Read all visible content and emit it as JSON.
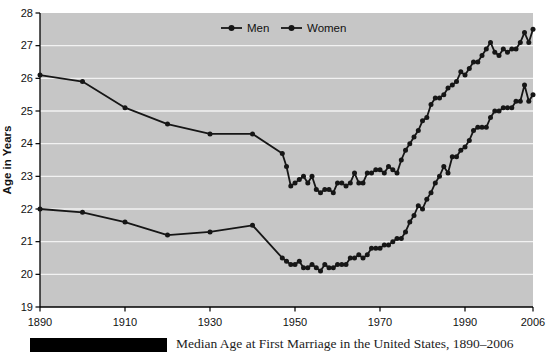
{
  "figure": {
    "caption": "Median Age at First Marriage in the United States, 1890–2006"
  },
  "chart_data": {
    "type": "line",
    "title": "",
    "xlabel": "",
    "ylabel": "Age in Years",
    "xlim": [
      1890,
      2006
    ],
    "ylim": [
      19,
      28
    ],
    "xticks": [
      1890,
      1910,
      1930,
      1950,
      1970,
      1990,
      2006
    ],
    "yticks": [
      19,
      20,
      21,
      22,
      23,
      24,
      25,
      26,
      27,
      28
    ],
    "grid": "horizontal-white-on-gray",
    "legend": {
      "position": "top-center-inside",
      "entries": [
        "Men",
        "Women"
      ]
    },
    "colors": {
      "plot_bg": "#c6c6c6",
      "gridline": "#f2f2f2",
      "line": "#161616",
      "axis": "#000000",
      "page_bg": "#ffffff"
    },
    "series": [
      {
        "name": "Men",
        "points": [
          [
            1890,
            26.1
          ],
          [
            1900,
            25.9
          ],
          [
            1910,
            25.1
          ],
          [
            1920,
            24.6
          ],
          [
            1930,
            24.3
          ],
          [
            1940,
            24.3
          ],
          [
            1947,
            23.7
          ],
          [
            1948,
            23.3
          ],
          [
            1949,
            22.7
          ],
          [
            1950,
            22.8
          ],
          [
            1951,
            22.9
          ],
          [
            1952,
            23.0
          ],
          [
            1953,
            22.8
          ],
          [
            1954,
            23.0
          ],
          [
            1955,
            22.6
          ],
          [
            1956,
            22.5
          ],
          [
            1957,
            22.6
          ],
          [
            1958,
            22.6
          ],
          [
            1959,
            22.5
          ],
          [
            1960,
            22.8
          ],
          [
            1961,
            22.8
          ],
          [
            1962,
            22.7
          ],
          [
            1963,
            22.8
          ],
          [
            1964,
            23.1
          ],
          [
            1965,
            22.8
          ],
          [
            1966,
            22.8
          ],
          [
            1967,
            23.1
          ],
          [
            1968,
            23.1
          ],
          [
            1969,
            23.2
          ],
          [
            1970,
            23.2
          ],
          [
            1971,
            23.1
          ],
          [
            1972,
            23.3
          ],
          [
            1973,
            23.2
          ],
          [
            1974,
            23.1
          ],
          [
            1975,
            23.5
          ],
          [
            1976,
            23.8
          ],
          [
            1977,
            24.0
          ],
          [
            1978,
            24.2
          ],
          [
            1979,
            24.4
          ],
          [
            1980,
            24.7
          ],
          [
            1981,
            24.8
          ],
          [
            1982,
            25.2
          ],
          [
            1983,
            25.4
          ],
          [
            1984,
            25.4
          ],
          [
            1985,
            25.5
          ],
          [
            1986,
            25.7
          ],
          [
            1987,
            25.8
          ],
          [
            1988,
            25.9
          ],
          [
            1989,
            26.2
          ],
          [
            1990,
            26.1
          ],
          [
            1991,
            26.3
          ],
          [
            1992,
            26.5
          ],
          [
            1993,
            26.5
          ],
          [
            1994,
            26.7
          ],
          [
            1995,
            26.9
          ],
          [
            1996,
            27.1
          ],
          [
            1997,
            26.8
          ],
          [
            1998,
            26.7
          ],
          [
            1999,
            26.9
          ],
          [
            2000,
            26.8
          ],
          [
            2001,
            26.9
          ],
          [
            2002,
            26.9
          ],
          [
            2003,
            27.1
          ],
          [
            2004,
            27.4
          ],
          [
            2005,
            27.1
          ],
          [
            2006,
            27.5
          ]
        ]
      },
      {
        "name": "Women",
        "points": [
          [
            1890,
            22.0
          ],
          [
            1900,
            21.9
          ],
          [
            1910,
            21.6
          ],
          [
            1920,
            21.2
          ],
          [
            1930,
            21.3
          ],
          [
            1940,
            21.5
          ],
          [
            1947,
            20.5
          ],
          [
            1948,
            20.4
          ],
          [
            1949,
            20.3
          ],
          [
            1950,
            20.3
          ],
          [
            1951,
            20.4
          ],
          [
            1952,
            20.2
          ],
          [
            1953,
            20.2
          ],
          [
            1954,
            20.3
          ],
          [
            1955,
            20.2
          ],
          [
            1956,
            20.1
          ],
          [
            1957,
            20.3
          ],
          [
            1958,
            20.2
          ],
          [
            1959,
            20.2
          ],
          [
            1960,
            20.3
          ],
          [
            1961,
            20.3
          ],
          [
            1962,
            20.3
          ],
          [
            1963,
            20.5
          ],
          [
            1964,
            20.5
          ],
          [
            1965,
            20.6
          ],
          [
            1966,
            20.5
          ],
          [
            1967,
            20.6
          ],
          [
            1968,
            20.8
          ],
          [
            1969,
            20.8
          ],
          [
            1970,
            20.8
          ],
          [
            1971,
            20.9
          ],
          [
            1972,
            20.9
          ],
          [
            1973,
            21.0
          ],
          [
            1974,
            21.1
          ],
          [
            1975,
            21.1
          ],
          [
            1976,
            21.3
          ],
          [
            1977,
            21.6
          ],
          [
            1978,
            21.8
          ],
          [
            1979,
            22.1
          ],
          [
            1980,
            22.0
          ],
          [
            1981,
            22.3
          ],
          [
            1982,
            22.5
          ],
          [
            1983,
            22.8
          ],
          [
            1984,
            23.0
          ],
          [
            1985,
            23.3
          ],
          [
            1986,
            23.1
          ],
          [
            1987,
            23.6
          ],
          [
            1988,
            23.6
          ],
          [
            1989,
            23.8
          ],
          [
            1990,
            23.9
          ],
          [
            1991,
            24.1
          ],
          [
            1992,
            24.4
          ],
          [
            1993,
            24.5
          ],
          [
            1994,
            24.5
          ],
          [
            1995,
            24.5
          ],
          [
            1996,
            24.8
          ],
          [
            1997,
            25.0
          ],
          [
            1998,
            25.0
          ],
          [
            1999,
            25.1
          ],
          [
            2000,
            25.1
          ],
          [
            2001,
            25.1
          ],
          [
            2002,
            25.3
          ],
          [
            2003,
            25.3
          ],
          [
            2004,
            25.8
          ],
          [
            2005,
            25.3
          ],
          [
            2006,
            25.5
          ]
        ]
      }
    ]
  }
}
